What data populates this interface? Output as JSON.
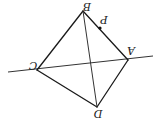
{
  "diagram": {
    "type": "geometry",
    "orientation": "rotated-180",
    "points": {
      "A": {
        "label": "A",
        "x": 128,
        "y": 60
      },
      "B": {
        "label": "B",
        "x": 83,
        "y": 11
      },
      "C": {
        "label": "C",
        "x": 37,
        "y": 70
      },
      "D": {
        "label": "D",
        "x": 97,
        "y": 107
      },
      "P": {
        "label": "P",
        "x": 100,
        "y": 28
      }
    },
    "line_extended": {
      "x1": 8,
      "y1": 72,
      "x2": 153,
      "y2": 56
    },
    "labels": {
      "A": "A",
      "B": "B",
      "C": "C",
      "D": "D",
      "P": "P"
    },
    "segments": [
      "AB",
      "BC",
      "CD",
      "DA",
      "BD",
      "CA"
    ],
    "stroke_color": "#1a1a1a"
  }
}
